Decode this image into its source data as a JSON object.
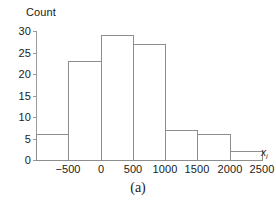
{
  "chart_data": {
    "type": "bar",
    "title": "",
    "subtitle": "",
    "xlabel": "x_i",
    "xlabel_base": "x",
    "xlabel_sub": "i",
    "ylabel": "Count",
    "categories": [
      "-1000 to -500",
      "-500 to 0",
      "0 to 500",
      "500 to 1000",
      "1000 to 1500",
      "1500 to 2000",
      "2000 to 2500"
    ],
    "bin_edges": [
      -1000,
      -500,
      0,
      500,
      1000,
      1500,
      2000,
      2500
    ],
    "values": [
      6,
      23,
      29,
      27,
      7,
      6,
      2
    ],
    "bin_width": 500,
    "xlim": [
      -1000,
      2500
    ],
    "ylim": [
      0,
      30
    ],
    "xticks": [
      -500,
      0,
      500,
      1000,
      1500,
      2000,
      2500
    ],
    "xtick_labels": [
      "−500",
      "0",
      "500",
      "1000",
      "1500",
      "2000",
      "2500"
    ],
    "yticks": [
      0,
      5,
      10,
      15,
      20,
      25,
      30
    ],
    "ytick_labels": [
      "0",
      "5",
      "10",
      "15",
      "20",
      "25",
      "30"
    ],
    "grid": false,
    "legend": null,
    "bar_fill_color": "#ffffff",
    "bar_edge_color": "#8d8d8d",
    "axis_color": "#9a9a9a",
    "text_color": "#1a1a1a"
  },
  "caption": "(a)"
}
